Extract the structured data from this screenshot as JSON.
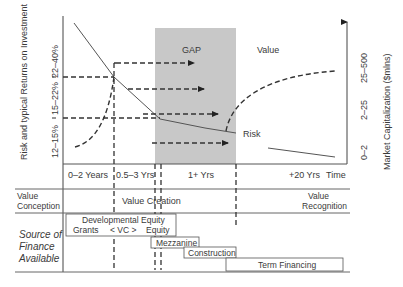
{
  "diagram": {
    "left_axis_label": "Risk and typical Returns on Investment",
    "left_axis_ticks": [
      "12–15%",
      "15–22%",
      "22–40%"
    ],
    "right_axis_label": "Market Capitalization ($mlns)",
    "right_axis_ticks": [
      "0–2",
      "2–25",
      "25–500"
    ],
    "x_ticks": [
      "0–2 Years",
      "0.5–3 Yrs",
      "1+ Yrs",
      "+20 Yrs"
    ],
    "x_axis_label": "Time",
    "gap_label": "GAP",
    "value_curve_label": "Value",
    "risk_curve_label": "Risk",
    "colors": {
      "gap_fill": "#c8c8c8",
      "line": "#333333",
      "grid": "#555555"
    },
    "stages": {
      "conception": [
        "Value",
        "Conception"
      ],
      "creation": "Value Creation",
      "recognition": [
        "Value",
        "Recognition"
      ]
    },
    "finance": {
      "row_label": [
        "Source of",
        "Finance",
        "Available"
      ],
      "boxes": {
        "developmental_equity": "Developmental Equity",
        "grants": "Grants",
        "vc": "< VC >",
        "equity": "Equity",
        "mezzanine": "Mezzanine",
        "construction": "Construction",
        "term_financing": "Term Financing"
      }
    }
  }
}
